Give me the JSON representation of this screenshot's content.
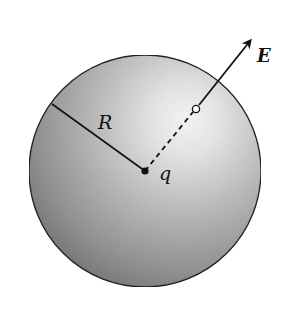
{
  "diagram": {
    "type": "charged-sphere-field",
    "labels": {
      "radius": "R",
      "charge": "q",
      "field": "E"
    },
    "geometry": {
      "sphere": {
        "cx": 145,
        "cy": 171,
        "r": 116
      },
      "center_point": {
        "x": 145,
        "y": 171
      },
      "radius_line_end": {
        "x": 52,
        "y": 104
      },
      "field_point": {
        "x": 196,
        "y": 109
      },
      "arrow_tip": {
        "x": 252,
        "y": 38
      }
    },
    "colors": {
      "sphere_light": "#f4f4f4",
      "sphere_mid": "#b8b8b8",
      "sphere_dark": "#6e6e6e",
      "ink": "#111111",
      "background": "#ffffff"
    }
  }
}
